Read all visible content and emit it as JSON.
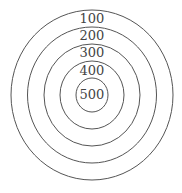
{
  "diagram": {
    "type": "concentric-circles",
    "rings": [
      {
        "label": "100",
        "rx": 81,
        "ry": 85
      },
      {
        "label": "200",
        "rx": 64.5,
        "ry": 68
      },
      {
        "label": "300",
        "rx": 48,
        "ry": 51
      },
      {
        "label": "400",
        "rx": 32,
        "ry": 34
      },
      {
        "label": "500",
        "rx": 16,
        "ry": 17
      }
    ],
    "stroke_color": "#555555",
    "text_color": "#444444"
  }
}
